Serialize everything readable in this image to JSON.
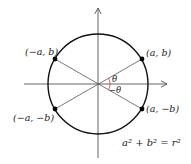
{
  "diagram": {
    "colors": {
      "circle": "#111111",
      "axes": "#555555",
      "radii": "#555555",
      "points": "#000000",
      "angle_arc": "#d04040",
      "text": "#222222"
    },
    "points": [
      {
        "id": "Q1",
        "label": "(a, b)",
        "x": 142,
        "y": 59
      },
      {
        "id": "Q2",
        "label": "(−a, b)",
        "x": 55,
        "y": 59
      },
      {
        "id": "Q3",
        "label": "(−a, −b)",
        "x": 55,
        "y": 109
      },
      {
        "id": "Q4",
        "label": "(a, −b)",
        "x": 142,
        "y": 109
      }
    ],
    "angles": {
      "upper": "θ",
      "lower": "−θ"
    },
    "equation": "a² + b² = r²"
  }
}
